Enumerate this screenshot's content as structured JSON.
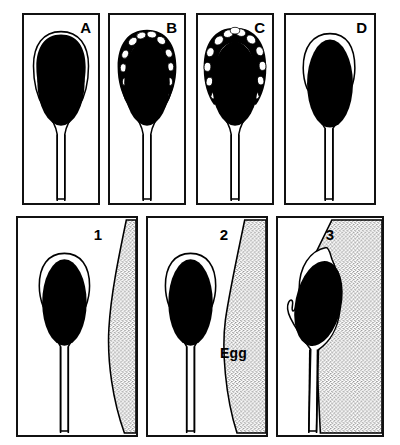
{
  "figure": {
    "width": 400,
    "height": 445,
    "background_color": "#ffffff",
    "ink_color": "#000000",
    "stipple_color": "#1a1a1a"
  },
  "top_row": {
    "description": "Stages of the acrosome reaction in a sperm head",
    "panels": [
      {
        "id": "panel-a",
        "label": "A",
        "stage": "intact-acrosome",
        "caption_text": "A"
      },
      {
        "id": "panel-b",
        "label": "B",
        "stage": "early-vesiculation",
        "caption_text": "B"
      },
      {
        "id": "panel-c",
        "label": "C",
        "stage": "advanced-vesiculation",
        "caption_text": "C"
      },
      {
        "id": "panel-d",
        "label": "D",
        "stage": "acrosome-shed",
        "caption_text": "D"
      }
    ]
  },
  "bottom_row": {
    "description": "Sperm approach, contact and penetration of the egg",
    "panels": [
      {
        "id": "panel-1",
        "label": "1",
        "stage": "approach",
        "caption_text": "1"
      },
      {
        "id": "panel-2",
        "label": "2",
        "stage": "contact",
        "caption_text": "2",
        "annotation": "Egg"
      },
      {
        "id": "panel-3",
        "label": "3",
        "stage": "penetration",
        "caption_text": "3"
      }
    ]
  },
  "annotations": {
    "egg_label": "Egg"
  }
}
